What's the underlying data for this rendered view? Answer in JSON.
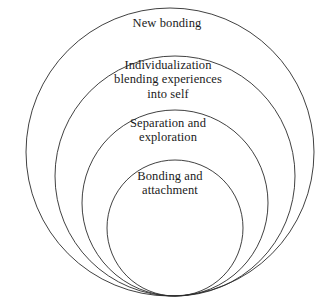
{
  "diagram": {
    "type": "nested-concentric-circles",
    "orientation": "bottom-tangent",
    "background_color": "#ffffff",
    "stroke_color": "#2b2b2b",
    "text_color": "#1a1a1a",
    "rings": [
      {
        "id": "new-bonding",
        "label": "New bonding",
        "order": 4,
        "level": "outermost",
        "cx": 170,
        "cy": 152,
        "r": 144
      },
      {
        "id": "individualization",
        "label": "Individualization\nblending experiences\ninto self",
        "order": 3,
        "level": "third",
        "cx": 175,
        "cy": 176,
        "r": 120
      },
      {
        "id": "separation",
        "label": "Separation and\nexploration",
        "order": 2,
        "level": "second",
        "cx": 175,
        "cy": 203,
        "r": 93
      },
      {
        "id": "bonding-attachment",
        "label": "Bonding and\nattachment",
        "order": 1,
        "level": "innermost",
        "cx": 175,
        "cy": 228,
        "r": 68
      }
    ]
  }
}
